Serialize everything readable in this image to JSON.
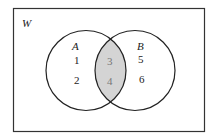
{
  "diagram": {
    "type": "venn",
    "universe_label": "W",
    "sets": [
      {
        "name": "A",
        "only_elements": [
          "1",
          "2"
        ]
      },
      {
        "name": "B",
        "only_elements": [
          "5",
          "6"
        ]
      }
    ],
    "intersection_elements": [
      "3",
      "4"
    ],
    "shaded_region": "A ∩ B",
    "colors": {
      "stroke": "#222222",
      "shade": "#d4d4d4",
      "background": "#ffffff"
    }
  }
}
